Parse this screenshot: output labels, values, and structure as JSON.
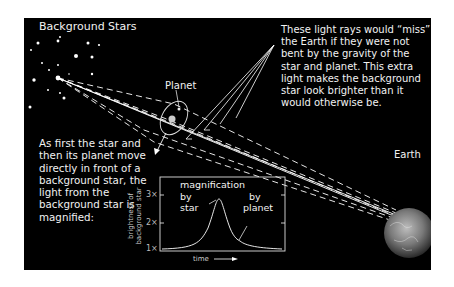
{
  "labels": {
    "background_stars": "Background Stars",
    "planet": "Planet",
    "earth": "Earth"
  },
  "notes": {
    "light_rays": "These light rays would “miss” the Earth if they were not bent by the gravity of the star and planet. This extra light makes the background star look brighter than it would otherwise be.",
    "magnified": "As first the star and then its planet move directly in front of a background star, the light from the background star is magnified:"
  },
  "graph": {
    "title": "magnification",
    "label_star_by": "by",
    "label_star": "star",
    "label_planet_by": "by",
    "label_planet": "planet",
    "ylabel_line1": "brightness of",
    "ylabel_line2": "background star",
    "xlabel": "time",
    "ticks": [
      "3×",
      "2×",
      "1×"
    ]
  },
  "colors": {
    "panel_bg": "#000000",
    "text": "#f2f2f2",
    "page_bg": "#ffffff"
  }
}
